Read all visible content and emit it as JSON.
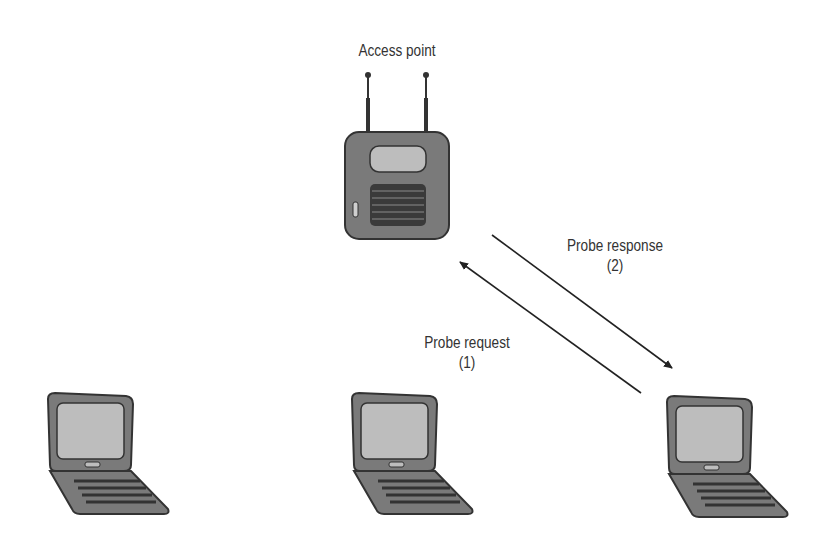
{
  "diagram": {
    "access_point": {
      "label": "Access point"
    },
    "arrows": [
      {
        "label": "Probe request",
        "step": "(1)",
        "direction": "laptop-to-access-point"
      },
      {
        "label": "Probe response",
        "step": "(2)",
        "direction": "access-point-to-laptop"
      }
    ],
    "laptops": [
      {
        "position": "left"
      },
      {
        "position": "center"
      },
      {
        "position": "right"
      }
    ],
    "colors": {
      "device_body": "#7a7a7a",
      "device_outline": "#333333",
      "screen": "#bdbdbd",
      "grille": "#3a3a3a",
      "text": "#333333",
      "arrow": "#222222"
    }
  }
}
